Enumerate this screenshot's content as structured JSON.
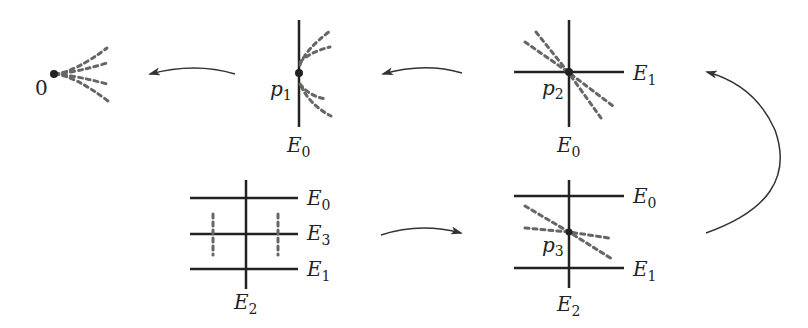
{
  "diagram": {
    "colors": {
      "line": "#222222",
      "dashed": "#666666",
      "arrow": "#333333"
    },
    "panels": [
      {
        "id": "origin",
        "point_label": "0"
      },
      {
        "id": "p1",
        "point_label": "p",
        "point_sub": "1",
        "divisors": [
          {
            "name": "E",
            "sub": "0"
          }
        ]
      },
      {
        "id": "p2",
        "point_label": "p",
        "point_sub": "2",
        "divisors": [
          {
            "name": "E",
            "sub": "1"
          },
          {
            "name": "E",
            "sub": "0"
          }
        ]
      },
      {
        "id": "p3",
        "point_label": "p",
        "point_sub": "3",
        "divisors": [
          {
            "name": "E",
            "sub": "0"
          },
          {
            "name": "E",
            "sub": "1"
          },
          {
            "name": "E",
            "sub": "2"
          }
        ]
      },
      {
        "id": "final",
        "divisors": [
          {
            "name": "E",
            "sub": "0"
          },
          {
            "name": "E",
            "sub": "3"
          },
          {
            "name": "E",
            "sub": "1"
          },
          {
            "name": "E",
            "sub": "2"
          }
        ]
      }
    ],
    "arrows": [
      {
        "from": "p1",
        "to": "origin"
      },
      {
        "from": "p2",
        "to": "p1"
      },
      {
        "from": "p3",
        "to": "p2"
      },
      {
        "from": "final",
        "to": "p3"
      }
    ]
  }
}
